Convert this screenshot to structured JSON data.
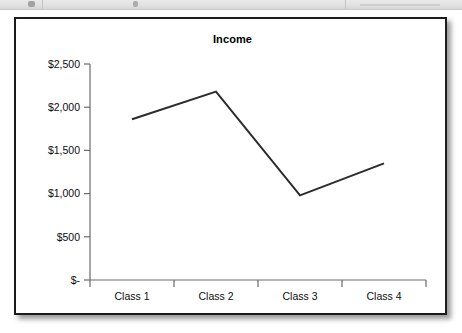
{
  "toolbar": {
    "visible_fragment": "cropped-toolbar-strip"
  },
  "chart_frame": {
    "border_color": "#1c1c1c",
    "background": "#ffffff"
  },
  "chart_data": {
    "type": "line",
    "title": "Income",
    "xlabel": "",
    "ylabel": "",
    "categories": [
      "Class 1",
      "Class 2",
      "Class 3",
      "Class 4"
    ],
    "values": [
      1860,
      2180,
      980,
      1350
    ],
    "series": [
      {
        "name": "Income",
        "values": [
          1860,
          2180,
          980,
          1350
        ],
        "color": "#2b2b2b"
      }
    ],
    "ylim": [
      0,
      2500
    ],
    "ytick_values": [
      0,
      500,
      1000,
      1500,
      2000,
      2500
    ],
    "ytick_labels": [
      "$-",
      "$500",
      "$1,000",
      "$1,500",
      "$2,000",
      "$2,500"
    ],
    "xtick_labels": [
      "Class 1",
      "Class 2",
      "Class 3",
      "Class 4"
    ],
    "grid": false,
    "legend": false,
    "legend_position": "none",
    "line_color": "#2b2b2b",
    "line_width": 2,
    "markers": false,
    "axis_color": "#6b6b6b"
  }
}
